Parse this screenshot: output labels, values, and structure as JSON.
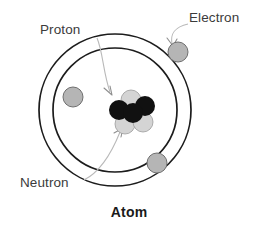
{
  "figure": {
    "caption": "Atom",
    "background_color": "#ffffff"
  },
  "labels": {
    "proton": "Proton",
    "electron": "Electron",
    "neutron": "Neutron"
  },
  "colors": {
    "orbit_stroke": "#1c1c1c",
    "proton_fill": "#111111",
    "neutron_fill": "#d4d4d4",
    "electron_fill": "#b5b5b5",
    "leader_stroke": "#b9b9b9",
    "text": "#3b3b3b",
    "caption_text": "#1a1a1a"
  },
  "diagram": {
    "type": "atom-bohr-model",
    "center": {
      "x": 115,
      "y": 110
    },
    "orbits": [
      {
        "name": "outer-orbit",
        "radius": 76
      },
      {
        "name": "inner-orbit",
        "radius": 62
      }
    ],
    "electrons": [
      {
        "name": "electron-top-right",
        "x": 178,
        "y": 52,
        "r": 10,
        "orbit": "outer-orbit"
      },
      {
        "name": "electron-left",
        "x": 73,
        "y": 97,
        "r": 10,
        "orbit": "inner-orbit"
      },
      {
        "name": "electron-bottom-right",
        "x": 157,
        "y": 163,
        "r": 10,
        "orbit": "inner-orbit"
      }
    ],
    "nucleus": {
      "center": {
        "x": 132,
        "y": 112
      },
      "particles": [
        {
          "name": "neutron-top",
          "type": "neutron",
          "x": 131,
          "y": 100,
          "r": 10
        },
        {
          "name": "proton-upper-right",
          "type": "proton",
          "x": 145,
          "y": 106,
          "r": 10
        },
        {
          "name": "proton-left",
          "type": "proton",
          "x": 119,
          "y": 110,
          "r": 10
        },
        {
          "name": "proton-center",
          "type": "proton",
          "x": 133,
          "y": 113,
          "r": 10
        },
        {
          "name": "neutron-bottom-left",
          "type": "neutron",
          "x": 125,
          "y": 124,
          "r": 10
        },
        {
          "name": "neutron-bottom-right",
          "type": "neutron",
          "x": 143,
          "y": 122,
          "r": 10
        }
      ]
    }
  }
}
